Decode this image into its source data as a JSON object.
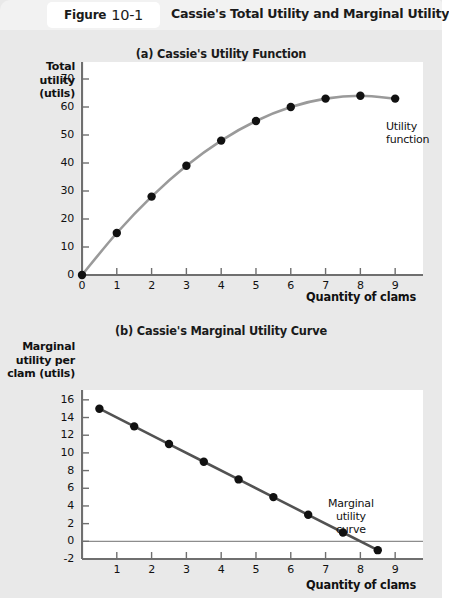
{
  "header": {
    "figure_word": "Figure",
    "figure_number": "10-1",
    "title": "Cassie's Total Utility and Marginal Utility"
  },
  "panel_a": {
    "subtitle": "(a) Cassie's Utility Function",
    "annotation": "Utility\nfunction",
    "annotation_line1": "Utility",
    "annotation_line2": "function"
  },
  "panel_b": {
    "subtitle": "(b) Cassie's Marginal Utility Curve",
    "annotation_line1": "Marginal",
    "annotation_line2": "utility",
    "annotation_line3": "curve"
  },
  "chart_data": [
    {
      "type": "line",
      "id": "cassie-utility-function",
      "title": "(a) Cassie's Utility Function",
      "xlabel": "Quantity of clams",
      "ylabel": "Total utility (utils)",
      "ylabel_lines": [
        "Total",
        "utility",
        "(utils)"
      ],
      "x": [
        0,
        1,
        2,
        3,
        4,
        5,
        6,
        7,
        8,
        9
      ],
      "values": [
        0,
        15,
        28,
        39,
        48,
        55,
        60,
        63,
        64,
        63
      ],
      "xticks": [
        "0",
        "1",
        "2",
        "3",
        "4",
        "5",
        "6",
        "7",
        "8",
        "9"
      ],
      "yticks": [
        "0",
        "10",
        "20",
        "30",
        "40",
        "50",
        "60",
        "70"
      ],
      "xlim": [
        0,
        9.8
      ],
      "ylim": [
        0,
        75
      ],
      "grid": false,
      "legend": "Utility function",
      "legend_position": "right-of-last-point",
      "series_color": "#9a9a9a",
      "marker_color": "#111111"
    },
    {
      "type": "line",
      "id": "cassie-marginal-utility-curve",
      "title": "(b) Cassie's Marginal Utility Curve",
      "xlabel": "Quantity of clams",
      "ylabel": "Marginal utility per clam (utils)",
      "ylabel_lines": [
        "Marginal",
        "utility per",
        "clam (utils)"
      ],
      "x": [
        0.5,
        1.5,
        2.5,
        3.5,
        4.5,
        5.5,
        6.5,
        7.5,
        8.5
      ],
      "values": [
        15,
        13,
        11,
        9,
        7,
        5,
        3,
        1,
        -1
      ],
      "xticks": [
        "1",
        "2",
        "3",
        "4",
        "5",
        "6",
        "7",
        "8",
        "9"
      ],
      "yticks": [
        "-2",
        "0",
        "2",
        "4",
        "6",
        "8",
        "10",
        "12",
        "14",
        "16"
      ],
      "xlim": [
        0,
        9.8
      ],
      "ylim": [
        -2,
        17
      ],
      "grid": false,
      "zero_line": true,
      "legend": "Marginal utility curve",
      "legend_position": "inside-right",
      "series_color": "#525252",
      "marker_color": "#111111"
    }
  ],
  "colors": {
    "page_background": "#e9e9e9",
    "header_band": "#f2f2f2",
    "panel_background": "#ffffff",
    "axis": "#6f6f6f",
    "text": "#111111"
  }
}
